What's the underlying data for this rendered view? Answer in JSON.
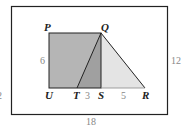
{
  "points": {
    "P": "P",
    "Q": "Q",
    "U": "U",
    "T": "T",
    "S": "S",
    "R": "R"
  },
  "measures": {
    "side_PU": "6",
    "TS": "3",
    "SR": "5",
    "outer_height": "12",
    "outer_width": "18",
    "partial_left": "2"
  },
  "colors": {
    "square": "#b5b5b5",
    "triangle_overlap": "#9a9a9a",
    "triangle": "#e4e4e4",
    "stroke": "#222222"
  }
}
